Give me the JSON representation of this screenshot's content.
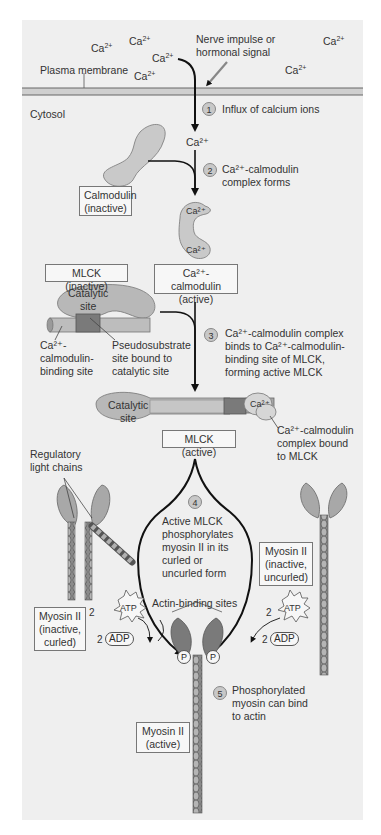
{
  "extracellular": {
    "ions": [
      {
        "label": "Ca",
        "charge": "2+"
      },
      {
        "label": "Ca",
        "charge": "2+"
      },
      {
        "label": "Ca",
        "charge": "2+"
      },
      {
        "label": "Ca",
        "charge": "2+"
      },
      {
        "label": "Ca",
        "charge": "2+"
      },
      {
        "label": "Ca",
        "charge": "2+"
      }
    ],
    "signal_label": "Nerve impulse or hormonal signal",
    "signal_line1": "Nerve impulse or",
    "signal_line2": "hormonal signal",
    "membrane_label": "Plasma membrane"
  },
  "cytosol_label": "Cytosol",
  "steps": [
    {
      "number": "1",
      "lines": [
        "Influx of calcium ions"
      ]
    },
    {
      "number": "2",
      "lines": [
        "Ca²⁺-calmodulin",
        "complex forms"
      ]
    },
    {
      "number": "3",
      "lines": [
        "Ca²⁺-calmodulin complex",
        "binds to Ca²⁺-calmodulin-",
        "binding site of MLCK,",
        "forming active MLCK"
      ]
    },
    {
      "number": "4",
      "lines": [
        "Active MLCK",
        "phosphorylates",
        "myosin II in its",
        "curled or",
        "uncurled form"
      ]
    },
    {
      "number": "5",
      "lines": [
        "Phosphorylated",
        "myosin can bind",
        "to actin"
      ]
    }
  ],
  "labels": {
    "ca_inside": "Ca²⁺",
    "calmodulin_inactive": [
      "Calmodulin",
      "(inactive)"
    ],
    "ca_calmodulin_active": [
      "Ca²⁺-calmodulin",
      "(active)"
    ],
    "ca_bound": "Ca²⁺",
    "mlck_inactive": "MLCK (inactive)",
    "catalytic_site": [
      "Catalytic",
      "site"
    ],
    "binding_site": [
      "Ca²⁺-",
      "calmodulin-",
      "binding site"
    ],
    "pseudosubstrate": [
      "Pseudosubstrate",
      "site bound to",
      "catalytic site"
    ],
    "mlck_active": "MLCK (active)",
    "complex_bound": [
      "Ca²⁺-calmodulin",
      "complex bound",
      "to MLCK"
    ],
    "regulatory_light_chains": [
      "Regulatory",
      "light chains"
    ],
    "myosin_curled": [
      "Myosin II",
      "(inactive,",
      "curled)"
    ],
    "myosin_uncurled": [
      "Myosin II",
      "(inactive,",
      "uncurled)"
    ],
    "myosin_active": [
      "Myosin II",
      "(active)"
    ],
    "actin_binding_sites": "Actin-binding sites",
    "atp": "ATP",
    "adp": "ADP",
    "coefficient": "2",
    "phosphate": "P"
  },
  "colors": {
    "panel_bg": "#efefef",
    "protein_light": "#c9c9c9",
    "protein_mid": "#a8a8a8",
    "protein_dark": "#7a7a7a",
    "membrane": "#cfcfcf",
    "arrow": "#111111"
  }
}
